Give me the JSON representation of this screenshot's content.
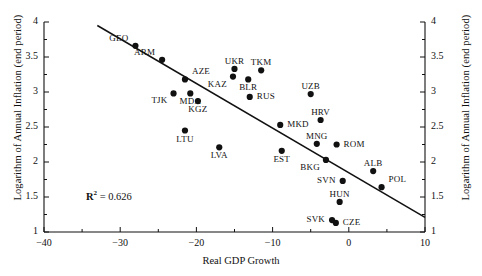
{
  "chart_data": {
    "type": "scatter",
    "title": "",
    "xlabel": "Real GDP Growth",
    "ylabel": "Logarithm of Annual Inflation (end period)",
    "ylabel_right": "Logarithm of Annual Inflation (end period)",
    "xlim": [
      -40,
      10
    ],
    "ylim": [
      1,
      4
    ],
    "xticks": [
      -40,
      -30,
      -20,
      -10,
      0,
      10
    ],
    "xtick_labels": [
      "−40",
      "−30",
      "−20",
      "−10",
      "0",
      "10"
    ],
    "yticks": [
      1,
      1.5,
      2,
      2.5,
      3,
      3.5,
      4
    ],
    "ytick_labels": [
      "1",
      "1.5",
      "2",
      "2.5",
      "3",
      "3.5",
      "4"
    ],
    "grid": false,
    "legend": "none",
    "annotations": [
      {
        "name": "r-squared",
        "text_prefix": "R",
        "text_sup": "2",
        "text_suffix": " = 0.626",
        "x": -34.5,
        "y": 1.5
      }
    ],
    "trendline": {
      "name": "regression-line",
      "x_start": -33.0,
      "y_start": 3.95,
      "x_end": 10.0,
      "y_end": 1.21
    },
    "points": [
      {
        "label": "GEO",
        "x": -28.0,
        "y": 3.66,
        "label_pos": "above-left"
      },
      {
        "label": "ARM",
        "x": -24.5,
        "y": 3.46,
        "label_pos": "above-left"
      },
      {
        "label": "AZE",
        "x": -21.5,
        "y": 3.18,
        "label_pos": "above-right"
      },
      {
        "label": "UKR",
        "x": -15.0,
        "y": 3.33,
        "label_pos": "above"
      },
      {
        "label": "KAZ",
        "x": -15.2,
        "y": 3.22,
        "label_pos": "below-left"
      },
      {
        "label": "TKM",
        "x": -11.5,
        "y": 3.31,
        "label_pos": "above"
      },
      {
        "label": "BLR",
        "x": -13.2,
        "y": 3.18,
        "label_pos": "below"
      },
      {
        "label": "TJK",
        "x": -23.0,
        "y": 2.98,
        "label_pos": "below-left"
      },
      {
        "label": "MDA",
        "x": -20.8,
        "y": 2.98,
        "label_pos": "below"
      },
      {
        "label": "KGZ",
        "x": -19.8,
        "y": 2.87,
        "label_pos": "below"
      },
      {
        "label": "RUS",
        "x": -13.0,
        "y": 2.93,
        "label_pos": "right"
      },
      {
        "label": "UZB",
        "x": -5.0,
        "y": 2.97,
        "label_pos": "above"
      },
      {
        "label": "HRV",
        "x": -3.7,
        "y": 2.6,
        "label_pos": "above"
      },
      {
        "label": "MKD",
        "x": -9.0,
        "y": 2.53,
        "label_pos": "right"
      },
      {
        "label": "LTU",
        "x": -21.5,
        "y": 2.45,
        "label_pos": "below"
      },
      {
        "label": "LVA",
        "x": -17.0,
        "y": 2.21,
        "label_pos": "below"
      },
      {
        "label": "MNG",
        "x": -4.2,
        "y": 2.26,
        "label_pos": "above"
      },
      {
        "label": "ROM",
        "x": -1.6,
        "y": 2.25,
        "label_pos": "right"
      },
      {
        "label": "EST",
        "x": -8.8,
        "y": 2.16,
        "label_pos": "below"
      },
      {
        "label": "BKG",
        "x": -3.0,
        "y": 2.03,
        "label_pos": "below-left"
      },
      {
        "label": "ALB",
        "x": 3.2,
        "y": 1.87,
        "label_pos": "above"
      },
      {
        "label": "SVN",
        "x": -0.8,
        "y": 1.73,
        "label_pos": "left"
      },
      {
        "label": "POL",
        "x": 4.3,
        "y": 1.64,
        "label_pos": "above-right"
      },
      {
        "label": "HUN",
        "x": -1.2,
        "y": 1.43,
        "label_pos": "above"
      },
      {
        "label": "SVK",
        "x": -2.2,
        "y": 1.17,
        "label_pos": "left"
      },
      {
        "label": "CZE",
        "x": -1.7,
        "y": 1.13,
        "label_pos": "right"
      }
    ]
  }
}
